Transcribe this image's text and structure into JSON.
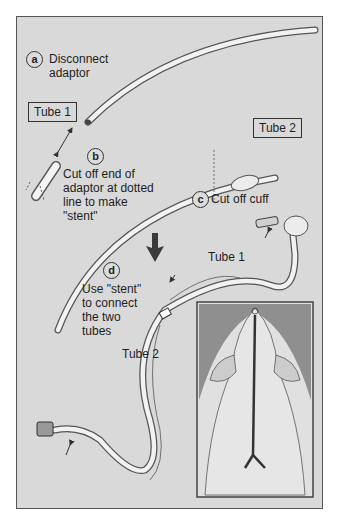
{
  "steps": {
    "a": {
      "marker": "a",
      "text_lines": [
        "Disconnect",
        "adaptor"
      ]
    },
    "b": {
      "marker": "b",
      "text_lines": [
        "Cut off end of",
        "adaptor at dotted",
        "line to make",
        "\"stent\""
      ]
    },
    "c": {
      "marker": "c",
      "text": "Cut off cuff"
    },
    "d": {
      "marker": "d",
      "text_lines": [
        "Use \"stent\"",
        "to connect",
        "the two",
        "tubes"
      ]
    }
  },
  "boxed_labels": {
    "tube1": "Tube 1",
    "tube2": "Tube 2"
  },
  "tube_labels": {
    "tube1": "Tube 1",
    "tube2": "Tube 2"
  },
  "colors": {
    "background": "#d9d9d9",
    "frame": "#555555",
    "tube_fill": "#f2f2f2",
    "tube_edge": "#555555",
    "inset_dark": "#8f8f8f",
    "inset_animal": "#e2e2e2",
    "arrow": "#3a3a3a"
  }
}
